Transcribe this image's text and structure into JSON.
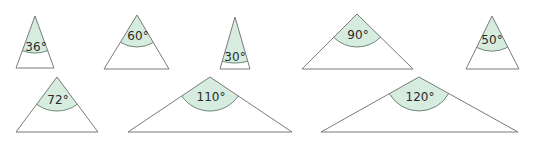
{
  "figure": {
    "width": 538,
    "height": 143,
    "colors": {
      "background": "#ffffff",
      "outline": "#7a7a7a",
      "sector_fill": "#d6ecdf",
      "sector_arc": "#6a8a78",
      "label": "#2b2b2b"
    },
    "triangles": [
      {
        "id": "t36",
        "label": "36°",
        "angle": 36,
        "apex": [
          35,
          16
        ],
        "left": [
          16,
          68
        ],
        "right": [
          54,
          68
        ],
        "radius": 37,
        "label_pos": [
          36,
          47
        ]
      },
      {
        "id": "t60",
        "label": "60°",
        "angle": 60,
        "apex": [
          137,
          15
        ],
        "left": [
          104,
          69
        ],
        "right": [
          169,
          69
        ],
        "radius": 32,
        "label_pos": [
          138,
          36
        ]
      },
      {
        "id": "t30",
        "label": "30°",
        "angle": 30,
        "apex": [
          235,
          17
        ],
        "left": [
          220,
          69
        ],
        "right": [
          250,
          69
        ],
        "radius": 46,
        "label_pos": [
          235,
          57
        ]
      },
      {
        "id": "t90",
        "label": "90°",
        "angle": 90,
        "apex": [
          357,
          14
        ],
        "left": [
          302,
          69
        ],
        "right": [
          413,
          69
        ],
        "radius": 33,
        "label_pos": [
          358,
          35
        ]
      },
      {
        "id": "t50",
        "label": "50°",
        "angle": 50,
        "apex": [
          492,
          16
        ],
        "left": [
          466,
          69
        ],
        "right": [
          519,
          69
        ],
        "radius": 35,
        "label_pos": [
          492,
          40
        ]
      },
      {
        "id": "t72",
        "label": "72°",
        "angle": 72,
        "apex": [
          57,
          77
        ],
        "left": [
          16,
          132
        ],
        "right": [
          98,
          132
        ],
        "radius": 34,
        "label_pos": [
          58,
          100
        ]
      },
      {
        "id": "t110",
        "label": "110°",
        "angle": 110,
        "apex": [
          210,
          77
        ],
        "left": [
          128,
          132
        ],
        "right": [
          292,
          132
        ],
        "radius": 34,
        "label_pos": [
          211,
          97
        ]
      },
      {
        "id": "t120",
        "label": "120°",
        "angle": 120,
        "apex": [
          419,
          77
        ],
        "left": [
          321,
          132
        ],
        "right": [
          518,
          132
        ],
        "radius": 34,
        "label_pos": [
          420,
          97
        ]
      }
    ]
  }
}
